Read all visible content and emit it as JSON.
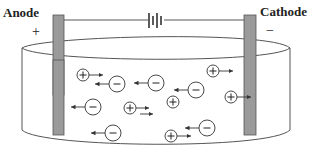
{
  "diagram": {
    "anode": {
      "label": "Anode",
      "sign": "+"
    },
    "cathode": {
      "label": "Cathode",
      "sign": "−"
    },
    "battery": {
      "name": "battery-symbol"
    },
    "colors": {
      "electrode": "#999999",
      "electrode_border": "#555555",
      "line": "#444444",
      "ion": "#333333"
    },
    "ions": [
      {
        "charge": "+",
        "x": 83,
        "y": 75,
        "arrow": "right"
      },
      {
        "charge": "−",
        "x": 117,
        "y": 84,
        "arrow": "left"
      },
      {
        "charge": "−",
        "x": 156,
        "y": 83,
        "arrow": "left"
      },
      {
        "charge": "+",
        "x": 213,
        "y": 71,
        "arrow": "right"
      },
      {
        "charge": "−",
        "x": 196,
        "y": 90,
        "arrow": "left"
      },
      {
        "charge": "+",
        "x": 173,
        "y": 102,
        "arrow": "none"
      },
      {
        "charge": "+",
        "x": 231,
        "y": 97,
        "arrow": "right"
      },
      {
        "charge": "−",
        "x": 93,
        "y": 107,
        "arrow": "left"
      },
      {
        "charge": "+",
        "x": 130,
        "y": 108,
        "arrow": "right-double"
      },
      {
        "charge": "−",
        "x": 113,
        "y": 133,
        "arrow": "left"
      },
      {
        "charge": "−",
        "x": 207,
        "y": 128,
        "arrow": "left"
      },
      {
        "charge": "+",
        "x": 171,
        "y": 136,
        "arrow": "right"
      }
    ]
  }
}
